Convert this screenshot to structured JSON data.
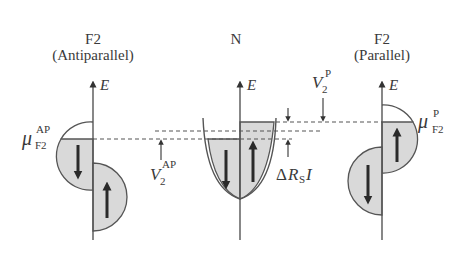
{
  "figure": {
    "panels": [
      {
        "id": "f2-antiparallel",
        "title": "F2",
        "subtitle": "(Antiparallel)",
        "axis_label": "E",
        "chem_potential": {
          "symbol": "μ",
          "sup": "AP",
          "sub": "F2"
        }
      },
      {
        "id": "n",
        "title": "N",
        "axis_label": "E"
      },
      {
        "id": "f2-parallel",
        "title": "F2",
        "subtitle": "(Parallel)",
        "axis_label": "E",
        "chem_potential": {
          "symbol": "μ",
          "sup": "P",
          "sub": "F2"
        }
      }
    ],
    "annotations": {
      "v2_ap": {
        "symbol": "V",
        "sub": "2",
        "sup": "AP"
      },
      "v2_p": {
        "symbol": "V",
        "sub": "2",
        "sup": "P"
      },
      "delta_rs_i": {
        "delta": "Δ",
        "R": "R",
        "sub": "S",
        "I": "I"
      }
    },
    "colors": {
      "fill": "#d9d9d9",
      "line": "#555555",
      "text": "#3a3a3a"
    }
  }
}
